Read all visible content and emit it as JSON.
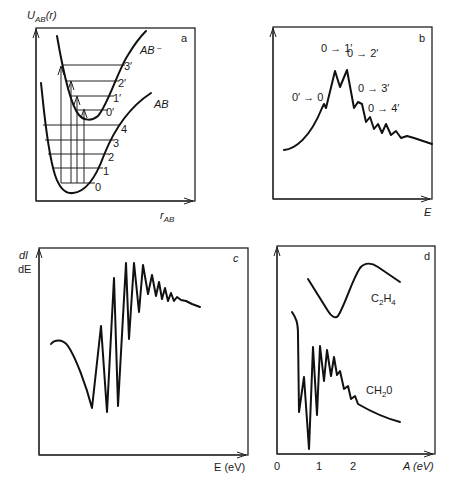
{
  "figure": {
    "panels": [
      {
        "id": "a",
        "panel_label": "a",
        "y_axis_label": "U",
        "y_axis_sub": "AB",
        "y_axis_suffix": "(r)",
        "x_axis_label": "r",
        "x_axis_sub": "AB",
        "curves": [
          {
            "name": "AB",
            "label": "AB"
          },
          {
            "name": "AB-",
            "label": "AB⁻"
          }
        ],
        "ab_levels": [
          "0",
          "1",
          "2",
          "3",
          "4"
        ],
        "ab_minus_levels": [
          "0′",
          "1′",
          "2′",
          "3′"
        ]
      },
      {
        "id": "b",
        "panel_label": "b",
        "x_axis_label": "E",
        "transition_labels": [
          "0′ → 0",
          "0 → 1′",
          "0 → 2′",
          "0 → 3′",
          "0 → 4′"
        ]
      },
      {
        "id": "c",
        "panel_label": "c",
        "y_axis_label_num": "dI",
        "y_axis_label_den": "dE",
        "x_axis_label": "E (eV)"
      },
      {
        "id": "d",
        "panel_label": "d",
        "x_axis_label": "A (eV)",
        "x_ticks": [
          "0",
          "1",
          "2"
        ],
        "series_labels": {
          "c2h4": {
            "main": "C",
            "sub1": "2",
            "mid": "H",
            "sub2": "4"
          },
          "ch2o": {
            "main": "CH",
            "sub1": "2",
            "mid": "0"
          }
        }
      }
    ]
  }
}
